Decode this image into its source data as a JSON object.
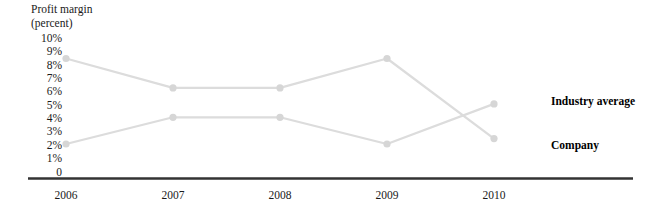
{
  "chart_data": {
    "type": "line",
    "title": "Profit margin\n(percent)",
    "ylabel": "Profit margin (percent)",
    "xlabel": "",
    "categories": [
      "2006",
      "2007",
      "2008",
      "2009",
      "2010"
    ],
    "ylim": [
      0,
      10
    ],
    "ytick_labels": [
      "10%",
      "9%",
      "8%",
      "7%",
      "6%",
      "5%",
      "4%",
      "3%",
      "2%",
      "1%",
      "0"
    ],
    "ytick_values": [
      10,
      9,
      8,
      7,
      6,
      5,
      4,
      3,
      2,
      1,
      0
    ],
    "grid": false,
    "legend_position": "right",
    "series": [
      {
        "name": "Industry average",
        "values": [
          8.5,
          6.3,
          6.3,
          8.5,
          2.5
        ],
        "color": "#dcdcdc"
      },
      {
        "name": "Company",
        "values": [
          2.1,
          4.1,
          4.1,
          2.1,
          5.1
        ],
        "color": "#dcdcdc"
      }
    ],
    "annotations": []
  },
  "legend": {
    "industry_label": "Industry average",
    "company_label": "Company"
  },
  "colors": {
    "line": "#dcdcdc",
    "marker": "#d6d6d6",
    "axis": "#333333",
    "text": "#1a1a1a"
  }
}
